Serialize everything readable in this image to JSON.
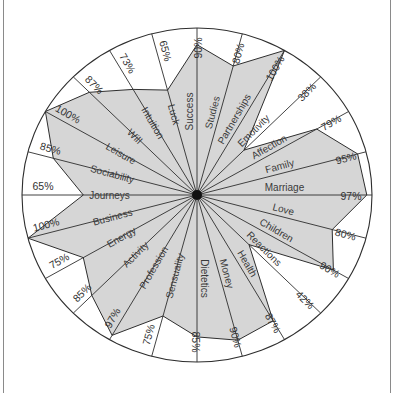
{
  "chart_data": {
    "type": "radar",
    "title": "",
    "axis_max": 100,
    "unit": "%",
    "start_angle_deg": 0,
    "direction": "clockwise",
    "grid": false,
    "categories": [
      "Success",
      "Studies",
      "Partnerships",
      "Emotivity",
      "Affection",
      "Family",
      "Marriage",
      "Love",
      "Children",
      "Reactions",
      "Health",
      "Money",
      "Dietetics",
      "Sensuality",
      "Profession",
      "Activity",
      "Energy",
      "Business",
      "Journeys",
      "Sociability",
      "Leisure",
      "Will",
      "Intuition",
      "Luck"
    ],
    "series": [
      {
        "name": "Profile",
        "values": [
          90,
          80,
          100,
          38,
          79,
          95,
          97,
          80,
          90,
          42,
          87,
          90,
          85,
          75,
          97,
          85,
          75,
          100,
          65,
          85,
          100,
          87,
          73,
          65
        ]
      }
    ],
    "value_labels": [
      "90%",
      "80%",
      "100%",
      "38%",
      "79%",
      "95%",
      "97%",
      "80%",
      "90%",
      "42%",
      "87%",
      "90%",
      "85%",
      "75%",
      "97%",
      "85%",
      "75%",
      "100%",
      "65%",
      "85%",
      "100%",
      "87%",
      "73%",
      "65%"
    ]
  },
  "style": {
    "fill_color": "#d6d6d6",
    "line_color": "#2e2e2e",
    "center_dot_color": "#111111",
    "background": "#ffffff"
  }
}
